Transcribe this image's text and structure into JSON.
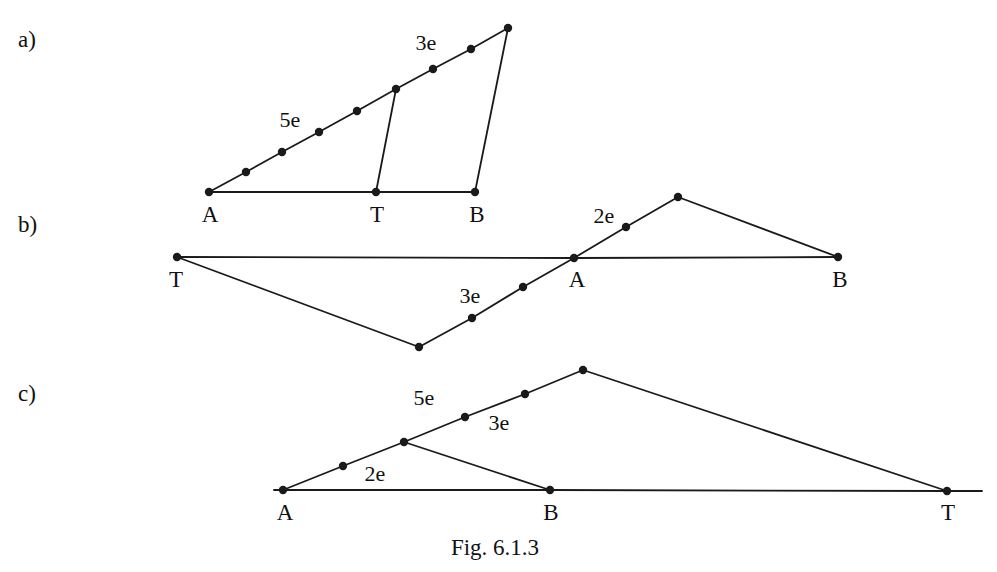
{
  "figure": {
    "caption": "Fig. 6.1.3",
    "caption_x": 495,
    "caption_y": 536,
    "line_color": "#1a1a1a",
    "dot_color": "#1a1a1a",
    "background": "#ffffff",
    "stroke_width": 1.8,
    "dot_radius": 4.2
  },
  "panels": [
    {
      "id": "a",
      "label": "a)",
      "label_x": 18,
      "label_y": 28,
      "polylines": [
        {
          "name": "base-line-a-b",
          "points": "209,192 376,192 475,192"
        },
        {
          "name": "diagonal-a-apex",
          "points": "209,192 246,172 282,152 319,132 357,111 396,89 433,69 471,49 508,28"
        },
        {
          "name": "chord-t-junction",
          "points": "376,192 396,89"
        },
        {
          "name": "chord-b-apex",
          "points": "475,192 508,28"
        }
      ],
      "dots": [
        {
          "name": "vertex-a",
          "x": 209,
          "y": 192
        },
        {
          "name": "slope-dot-1",
          "x": 246,
          "y": 172
        },
        {
          "name": "slope-dot-2",
          "x": 282,
          "y": 152
        },
        {
          "name": "slope-dot-3",
          "x": 319,
          "y": 132
        },
        {
          "name": "slope-dot-4",
          "x": 357,
          "y": 111
        },
        {
          "name": "junction-dot",
          "x": 396,
          "y": 89
        },
        {
          "name": "slope-dot-6",
          "x": 433,
          "y": 69
        },
        {
          "name": "slope-dot-7",
          "x": 471,
          "y": 49
        },
        {
          "name": "apex-dot",
          "x": 508,
          "y": 28
        },
        {
          "name": "vertex-t",
          "x": 376,
          "y": 192
        },
        {
          "name": "vertex-b",
          "x": 475,
          "y": 192
        }
      ],
      "vertex_labels": [
        {
          "name": "vertex-label-a",
          "text": "A",
          "x": 210,
          "y": 203
        },
        {
          "name": "vertex-label-t",
          "text": "T",
          "x": 377,
          "y": 203
        },
        {
          "name": "vertex-label-b",
          "text": "B",
          "x": 477,
          "y": 203
        }
      ],
      "edge_labels": [
        {
          "name": "edge-label-5e",
          "text": "5e",
          "x": 290,
          "y": 120
        },
        {
          "name": "edge-label-3e",
          "text": "3e",
          "x": 426,
          "y": 43
        }
      ]
    },
    {
      "id": "b",
      "label": "b)",
      "label_x": 18,
      "label_y": 213,
      "polylines": [
        {
          "name": "base-line-t-b",
          "points": "177,257 574,258 838,257"
        },
        {
          "name": "path-t-down-up-apex",
          "points": "177,257 419,347 472,318 523,287 574,258 626,227 678,197"
        },
        {
          "name": "chord-apex-b",
          "points": "678,197 838,257"
        }
      ],
      "dots": [
        {
          "name": "vertex-t",
          "x": 177,
          "y": 257
        },
        {
          "name": "bottom-vertex-dot",
          "x": 419,
          "y": 347
        },
        {
          "name": "slope-dot-1",
          "x": 472,
          "y": 318
        },
        {
          "name": "slope-dot-2",
          "x": 523,
          "y": 287
        },
        {
          "name": "vertex-a",
          "x": 574,
          "y": 258
        },
        {
          "name": "slope-dot-3",
          "x": 626,
          "y": 227
        },
        {
          "name": "apex-dot",
          "x": 678,
          "y": 197
        },
        {
          "name": "vertex-b",
          "x": 838,
          "y": 257
        }
      ],
      "vertex_labels": [
        {
          "name": "vertex-label-t",
          "text": "T",
          "x": 176,
          "y": 268
        },
        {
          "name": "vertex-label-a",
          "text": "A",
          "x": 577,
          "y": 268
        },
        {
          "name": "vertex-label-b",
          "text": "B",
          "x": 840,
          "y": 268
        }
      ],
      "edge_labels": [
        {
          "name": "edge-label-2e",
          "text": "2e",
          "x": 604,
          "y": 216
        },
        {
          "name": "edge-label-3e",
          "text": "3e",
          "x": 470,
          "y": 296
        }
      ]
    },
    {
      "id": "c",
      "label": "c)",
      "label_x": 18,
      "label_y": 382,
      "polylines": [
        {
          "name": "base-line-a-t",
          "points": "274,490 550,490 947,491 982,491"
        },
        {
          "name": "path-a-apex",
          "points": "283,490 343,466 404,442 465,417 525,394 583,370"
        },
        {
          "name": "chord-junction-b",
          "points": "404,442 550,490"
        },
        {
          "name": "chord-apex-t",
          "points": "583,370 947,491"
        }
      ],
      "dots": [
        {
          "name": "vertex-a",
          "x": 283,
          "y": 490
        },
        {
          "name": "slope-dot-1",
          "x": 343,
          "y": 466
        },
        {
          "name": "junction-dot",
          "x": 404,
          "y": 442
        },
        {
          "name": "slope-dot-2",
          "x": 465,
          "y": 417
        },
        {
          "name": "slope-dot-3",
          "x": 525,
          "y": 394
        },
        {
          "name": "apex-dot",
          "x": 583,
          "y": 370
        },
        {
          "name": "vertex-b",
          "x": 550,
          "y": 490
        },
        {
          "name": "vertex-t",
          "x": 947,
          "y": 491
        }
      ],
      "vertex_labels": [
        {
          "name": "vertex-label-a",
          "text": "A",
          "x": 285,
          "y": 501
        },
        {
          "name": "vertex-label-b",
          "text": "B",
          "x": 551,
          "y": 501
        },
        {
          "name": "vertex-label-t",
          "text": "T",
          "x": 948,
          "y": 501
        }
      ],
      "edge_labels": [
        {
          "name": "edge-label-5e",
          "text": "5e",
          "x": 424,
          "y": 398
        },
        {
          "name": "edge-label-3e",
          "text": "3e",
          "x": 499,
          "y": 423
        },
        {
          "name": "edge-label-2e",
          "text": "2e",
          "x": 375,
          "y": 474
        }
      ]
    }
  ]
}
